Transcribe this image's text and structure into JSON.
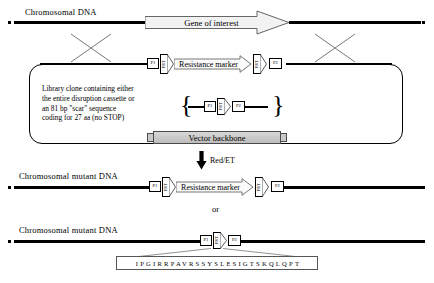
{
  "figure": {
    "type": "molecular-biology-scheme",
    "title_row1": "Chromosomal DNA",
    "gene_arrow_label": "Gene of interest",
    "crossover_symbol": "X",
    "plasmid": {
      "clone_text_lines": [
        "Library clone containing either",
        "the entire disruption cassette or",
        "an 81 bp \"scar\" sequence",
        "coding for 27 aa (no STOP)"
      ],
      "cassette": {
        "primer_left": "P1",
        "frt_left": "FRT",
        "marker_label": "Resistance marker",
        "frt_right": "FRT",
        "primer_right": "P2"
      },
      "scar_cassette": {
        "primer_left": "P1",
        "frt": "FRT",
        "primer_right": "P2"
      },
      "vector_backbone_label": "Vector backbone",
      "bracket_left": "{",
      "bracket_right": "}"
    },
    "reaction_arrow_label": "Red/ET",
    "result_marker": {
      "title": "Chromosomal mutant DNA",
      "primer_left": "P1",
      "frt_left": "FRT",
      "marker_label": "Resistance marker",
      "frt_right": "FRT",
      "primer_right": "P2"
    },
    "or_label": "or",
    "result_scar": {
      "title": "Chromosomal mutant DNA",
      "primer_left": "P1",
      "frt": "FRT",
      "primer_right": "P2"
    },
    "scar_peptide_sequence": "IPGIRRPAVRSSYSLESIGTSKQLQPT",
    "colors": {
      "line": "#000000",
      "backbone_fill": "#c9c9c9",
      "backbone_stroke": "#4a4a4a",
      "marker_stroke": "#666666"
    }
  }
}
